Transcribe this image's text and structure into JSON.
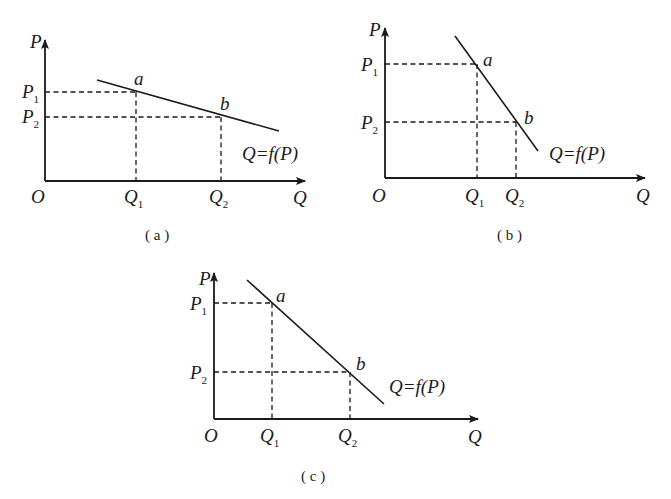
{
  "diagrams": [
    {
      "id": "a",
      "caption": "( a )",
      "y_axis_label": "P",
      "x_axis_label": "Q",
      "origin_label": "O",
      "p1": {
        "base": "P",
        "sub": "1"
      },
      "p2": {
        "base": "P",
        "sub": "2"
      },
      "q1": {
        "base": "Q",
        "sub": "1"
      },
      "q2": {
        "base": "Q",
        "sub": "2"
      },
      "point_a": "a",
      "point_b": "b",
      "curve_label": "Q=f(P)",
      "slope": "flat (elastic)"
    },
    {
      "id": "b",
      "caption": "( b )",
      "y_axis_label": "P",
      "x_axis_label": "Q",
      "origin_label": "O",
      "p1": {
        "base": "P",
        "sub": "1"
      },
      "p2": {
        "base": "P",
        "sub": "2"
      },
      "q1": {
        "base": "Q",
        "sub": "1"
      },
      "q2": {
        "base": "Q",
        "sub": "2"
      },
      "point_a": "a",
      "point_b": "b",
      "curve_label": "Q=f(P)",
      "slope": "steep (inelastic)"
    },
    {
      "id": "c",
      "caption": "( c )",
      "y_axis_label": "P",
      "x_axis_label": "Q",
      "origin_label": "O",
      "p1": {
        "base": "P",
        "sub": "1"
      },
      "p2": {
        "base": "P",
        "sub": "2"
      },
      "q1": {
        "base": "Q",
        "sub": "1"
      },
      "q2": {
        "base": "Q",
        "sub": "2"
      },
      "point_a": "a",
      "point_b": "b",
      "curve_label": "Q=f(P)",
      "slope": "unit (45 degree)"
    }
  ]
}
